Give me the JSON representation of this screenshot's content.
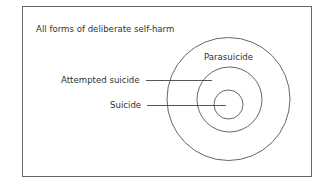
{
  "diagram": {
    "type": "nested-circles",
    "frame_label": "All forms of deliberate self-harm",
    "circles": [
      {
        "name": "outer",
        "label": "Parasuicide"
      },
      {
        "name": "middle",
        "label": "Attempted suicide"
      },
      {
        "name": "inner",
        "label": "Suicide"
      }
    ],
    "colors": {
      "stroke": "#555555",
      "text": "#333333",
      "background": "#ffffff"
    }
  }
}
